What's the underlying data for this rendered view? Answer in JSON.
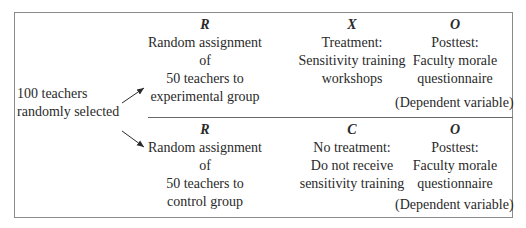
{
  "source": {
    "lines": [
      "100 teachers",
      "randomly selected"
    ]
  },
  "experimental": {
    "assignment": {
      "symbol": "R",
      "lines": [
        "Random assignment",
        "of",
        "50 teachers to",
        "experimental group"
      ]
    },
    "treatment": {
      "symbol": "X",
      "lines": [
        "Treatment:",
        "Sensitivity training",
        "workshops"
      ]
    },
    "posttest": {
      "symbol": "O",
      "lines": [
        "Posttest:",
        "Faculty morale",
        "questionnaire"
      ],
      "note": "(Dependent variable)"
    }
  },
  "control": {
    "assignment": {
      "symbol": "R",
      "lines": [
        "Random assignment",
        "of",
        "50 teachers to",
        "control group"
      ]
    },
    "treatment": {
      "symbol": "C",
      "lines": [
        "No treatment:",
        "Do not receive",
        "sensitivity training"
      ]
    },
    "posttest": {
      "symbol": "O",
      "lines": [
        "Posttest:",
        "Faculty morale",
        "questionnaire"
      ],
      "note": "(Dependent variable)"
    }
  },
  "colors": {
    "border": "#8a8a8a",
    "text": "#2a2a2a"
  }
}
